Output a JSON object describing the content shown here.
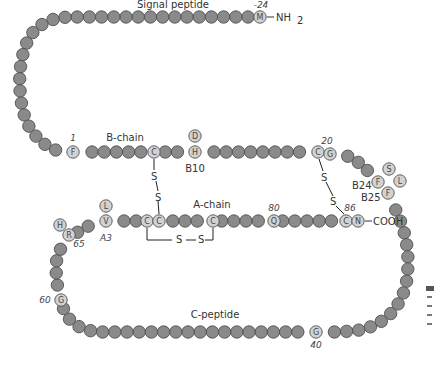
{
  "diagram": {
    "colors": {
      "bead_fill": "#8a8a8a",
      "bead_stroke": "#4f4f4f",
      "labeled_bead_fill": "#d2d2d2",
      "line": "#222222",
      "background": "#ffffff"
    },
    "regions": {
      "signal_peptide": "Signal peptide",
      "b_chain": "B-chain",
      "a_chain": "A-chain",
      "c_peptide": "C-peptide"
    },
    "termini": {
      "n_terminus": "NH",
      "n_terminus_sub": "2",
      "c_terminus": "COOH"
    },
    "position_numbers": {
      "p_minus24": "-24",
      "p1": "1",
      "p20": "20",
      "p40": "40",
      "p60": "60",
      "p65": "65",
      "p80": "80",
      "p86": "86"
    },
    "site_labels": {
      "b10": "B10",
      "b24": "B24",
      "b25": "B25",
      "a3": "A3"
    },
    "disulfide_label": "S",
    "labeled_residues": [
      {
        "letter": "M",
        "x": 260,
        "y": 17
      },
      {
        "letter": "F",
        "x": 73,
        "y": 152
      },
      {
        "letter": "C",
        "x": 154,
        "y": 152
      },
      {
        "letter": "H",
        "x": 195,
        "y": 152
      },
      {
        "letter": "D",
        "x": 195,
        "y": 136
      },
      {
        "letter": "C",
        "x": 318,
        "y": 152
      },
      {
        "letter": "G",
        "x": 330,
        "y": 154
      },
      {
        "letter": "F",
        "x": 378,
        "y": 182
      },
      {
        "letter": "S",
        "x": 389,
        "y": 169
      },
      {
        "letter": "L",
        "x": 400,
        "y": 181
      },
      {
        "letter": "F",
        "x": 388,
        "y": 193
      },
      {
        "letter": "C",
        "x": 346,
        "y": 221
      },
      {
        "letter": "N",
        "x": 358,
        "y": 221
      },
      {
        "letter": "Q",
        "x": 274,
        "y": 221
      },
      {
        "letter": "C",
        "x": 213,
        "y": 221
      },
      {
        "letter": "C",
        "x": 147,
        "y": 221
      },
      {
        "letter": "C",
        "x": 159,
        "y": 221
      },
      {
        "letter": "V",
        "x": 106,
        "y": 221
      },
      {
        "letter": "L",
        "x": 106,
        "y": 206
      },
      {
        "letter": "H",
        "x": 60,
        "y": 225
      },
      {
        "letter": "R",
        "x": 69,
        "y": 235
      },
      {
        "letter": "G",
        "x": 61,
        "y": 300
      },
      {
        "letter": "G",
        "x": 316,
        "y": 332
      }
    ],
    "caption_fragment_lines": 5
  }
}
